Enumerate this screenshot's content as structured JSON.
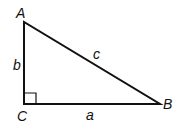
{
  "diagram": {
    "type": "right-triangle",
    "vertices": {
      "A": {
        "label": "A",
        "x": 24,
        "y": 22
      },
      "B": {
        "label": "B",
        "x": 160,
        "y": 104
      },
      "C": {
        "label": "C",
        "x": 24,
        "y": 104
      }
    },
    "sides": {
      "a": {
        "label": "a",
        "between": [
          "C",
          "B"
        ]
      },
      "b": {
        "label": "b",
        "between": [
          "A",
          "C"
        ]
      },
      "c": {
        "label": "c",
        "between": [
          "A",
          "B"
        ]
      }
    },
    "right_angle_at": "C",
    "colors": {
      "stroke": "#111111",
      "background": "#ffffff"
    }
  }
}
